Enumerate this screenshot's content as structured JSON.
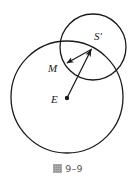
{
  "figure": {
    "caption_prefix": "圖",
    "caption_number": "9–9",
    "colors": {
      "stroke": "#1a1a1a",
      "background": "#ffffff",
      "caption": "#555555"
    },
    "circles": [
      {
        "name": "large-circle",
        "center_label": "E",
        "cx": 67,
        "cy": 97,
        "r": 56
      },
      {
        "name": "small-circle",
        "center_label": "S'",
        "cx": 93,
        "cy": 47,
        "r": 33
      }
    ],
    "points": [
      {
        "label": "E",
        "x": 67,
        "y": 98,
        "marker": "filled-dot"
      },
      {
        "label": "S'",
        "x": 92,
        "y": 49
      },
      {
        "label": "M",
        "x": 67,
        "y": 63
      }
    ],
    "arrows": [
      {
        "name": "arrow-e-to-s-prime",
        "from": "E",
        "to": "S'"
      },
      {
        "name": "arrow-s-prime-to-m",
        "from": "S'",
        "to": "M"
      }
    ],
    "labels": {
      "s_prime": "S′",
      "m": "M",
      "e": "E"
    }
  }
}
